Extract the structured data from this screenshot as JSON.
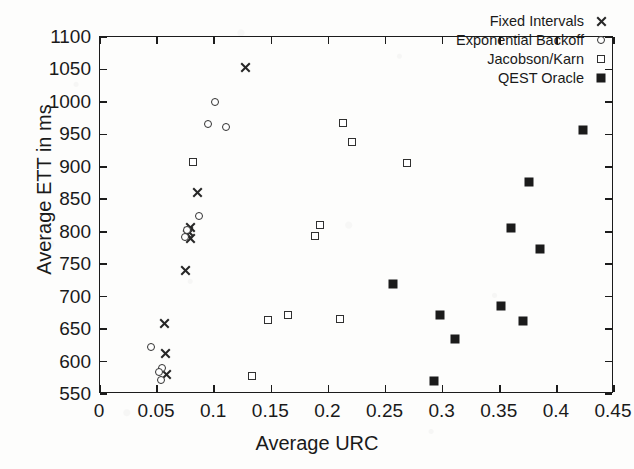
{
  "chart_data": {
    "type": "scatter",
    "title": "",
    "xlabel": "Average URC",
    "ylabel": "Average ETT in ms",
    "xlim": [
      0,
      0.45
    ],
    "ylim": [
      550,
      1100
    ],
    "xticks": [
      "0",
      "0.05",
      "0.1",
      "0.15",
      "0.2",
      "0.25",
      "0.3",
      "0.35",
      "0.4",
      "0.45"
    ],
    "xtick_values": [
      0,
      0.05,
      0.1,
      0.15,
      0.2,
      0.25,
      0.3,
      0.35,
      0.4,
      0.45
    ],
    "yticks": [
      "550",
      "600",
      "650",
      "700",
      "750",
      "800",
      "850",
      "900",
      "950",
      "1000",
      "1050",
      "1100"
    ],
    "ytick_values": [
      550,
      600,
      650,
      700,
      750,
      800,
      850,
      900,
      950,
      1000,
      1050,
      1100
    ],
    "grid": false,
    "legend_position": "top-right",
    "series": [
      {
        "name": "Fixed Intervals",
        "marker": "cross",
        "color": "#262626",
        "points": [
          [
            0.1275,
            1053
          ],
          [
            0.0855,
            860
          ],
          [
            0.0795,
            806
          ],
          [
            0.0775,
            800
          ],
          [
            0.0765,
            795
          ],
          [
            0.079,
            789
          ],
          [
            0.0745,
            741
          ],
          [
            0.0565,
            658
          ],
          [
            0.057,
            613
          ],
          [
            0.058,
            580
          ]
        ]
      },
      {
        "name": "Exponential Backoff",
        "marker": "circle",
        "color": "#303030",
        "points": [
          [
            0.1005,
            1000
          ],
          [
            0.0945,
            966
          ],
          [
            0.1105,
            962
          ],
          [
            0.0865,
            824
          ],
          [
            0.076,
            803
          ],
          [
            0.074,
            792
          ],
          [
            0.045,
            623
          ],
          [
            0.0545,
            590
          ],
          [
            0.052,
            584
          ],
          [
            0.0535,
            571
          ]
        ]
      },
      {
        "name": "Jacobson/Karn",
        "marker": "open-square",
        "color": "#303030",
        "points": [
          [
            0.213,
            968
          ],
          [
            0.2205,
            938
          ],
          [
            0.2685,
            906
          ],
          [
            0.081,
            908
          ],
          [
            0.1925,
            810
          ],
          [
            0.188,
            793
          ],
          [
            0.165,
            671
          ],
          [
            0.2105,
            665
          ],
          [
            0.147,
            664
          ],
          [
            0.133,
            578
          ]
        ]
      },
      {
        "name": "QEST Oracle",
        "marker": "filled-square",
        "color": "#1b1b1b",
        "points": [
          [
            0.4225,
            957
          ],
          [
            0.3755,
            876
          ],
          [
            0.3595,
            806
          ],
          [
            0.3855,
            773
          ],
          [
            0.2565,
            719
          ],
          [
            0.351,
            685
          ],
          [
            0.298,
            671
          ],
          [
            0.37,
            662
          ],
          [
            0.3105,
            635
          ],
          [
            0.2925,
            570
          ]
        ]
      }
    ]
  },
  "legend": {
    "items": [
      {
        "label": "Fixed Intervals",
        "marker": "cross"
      },
      {
        "label": "Exponential Backoff",
        "marker": "circle"
      },
      {
        "label": "Jacobson/Karn",
        "marker": "open-square"
      },
      {
        "label": "QEST Oracle",
        "marker": "filled-square"
      }
    ]
  }
}
